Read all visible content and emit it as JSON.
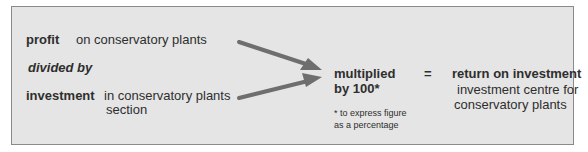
{
  "left": {
    "profit_label": "profit",
    "profit_desc": "on conservatory plants",
    "divided_by": "divided by",
    "investment_label": "investment",
    "investment_desc_line1": "in conservatory plants",
    "investment_desc_line2": "section"
  },
  "middle": {
    "multiplied_line1": "multiplied",
    "multiplied_line2": "by 100*",
    "footnote_line1": "* to express figure",
    "footnote_line2": "as a percentage"
  },
  "equals": "=",
  "right": {
    "title": "return on investment",
    "desc_line1": "investment centre for",
    "desc_line2": "conservatory plants"
  },
  "colors": {
    "background": "#e5e5e5",
    "border": "#8a8a8a",
    "text": "#2e2e2e",
    "arrow": "#6e6e6e"
  }
}
